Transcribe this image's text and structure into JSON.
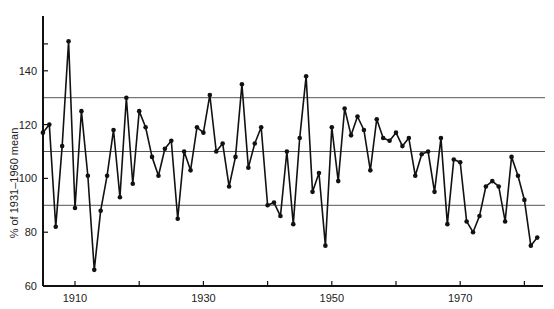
{
  "chart_data": {
    "type": "line",
    "title": "",
    "xlabel": "",
    "ylabel": "% of 1931–1960 mean",
    "xlim": [
      1904,
      1983
    ],
    "ylim": [
      60,
      155
    ],
    "grid": false,
    "legend": null,
    "x_ticks": [
      1910,
      1920,
      1930,
      1940,
      1950,
      1960,
      1970,
      1980
    ],
    "x_tick_labels": [
      "1910",
      "1930",
      "1950",
      "1970"
    ],
    "y_ticks": [
      60,
      80,
      100,
      120,
      140,
      150
    ],
    "y_tick_labels": [
      "60",
      "80",
      "100",
      "120",
      "140"
    ],
    "reference_lines": [
      130,
      110,
      90
    ],
    "x": [
      1905,
      1906,
      1907,
      1908,
      1909,
      1910,
      1911,
      1912,
      1913,
      1914,
      1915,
      1916,
      1917,
      1918,
      1919,
      1920,
      1921,
      1922,
      1923,
      1924,
      1925,
      1926,
      1927,
      1928,
      1929,
      1930,
      1931,
      1932,
      1933,
      1934,
      1935,
      1936,
      1937,
      1938,
      1939,
      1940,
      1941,
      1942,
      1943,
      1944,
      1945,
      1946,
      1947,
      1948,
      1949,
      1950,
      1951,
      1952,
      1953,
      1954,
      1955,
      1956,
      1957,
      1958,
      1959,
      1960,
      1961,
      1962,
      1963,
      1964,
      1965,
      1966,
      1967,
      1968,
      1969,
      1970,
      1971,
      1972,
      1973,
      1974,
      1975,
      1976,
      1977,
      1978,
      1979,
      1980,
      1981,
      1982
    ],
    "series": [
      {
        "name": "% of 1931–1960 mean",
        "values": [
          117,
          120,
          82,
          112,
          151,
          89,
          125,
          101,
          66,
          88,
          101,
          118,
          93,
          130,
          98,
          125,
          119,
          108,
          101,
          111,
          114,
          85,
          110,
          103,
          119,
          117,
          131,
          110,
          113,
          97,
          108,
          135,
          104,
          113,
          119,
          90,
          91,
          86,
          110,
          83,
          115,
          138,
          95,
          102,
          75,
          119,
          99,
          126,
          116,
          123,
          118,
          103,
          122,
          115,
          114,
          117,
          112,
          115,
          101,
          109,
          110,
          95,
          115,
          83,
          107,
          106,
          84,
          80,
          86,
          97,
          99,
          97,
          84,
          108,
          101,
          92,
          75,
          78
        ]
      }
    ]
  },
  "axes": {
    "y_label": "% of 1931–1960 mean",
    "y_ticks": [
      "140",
      "120",
      "100",
      "80",
      "60"
    ],
    "x_ticks": [
      "1910",
      "1930",
      "1950",
      "1970"
    ]
  }
}
